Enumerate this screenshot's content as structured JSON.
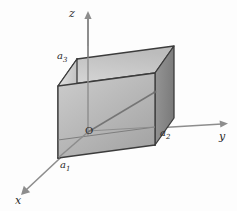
{
  "figure": {
    "background_color": "#fdfdfd",
    "stroke_color": "#3c3c3c",
    "axis_color": "#8d8d8d",
    "labels": {
      "axis_z": "z",
      "axis_y": "y",
      "axis_x": "x",
      "vertex_a1": "a",
      "vertex_a1_sub": "1",
      "vertex_a2": "a",
      "vertex_a2_sub": "2",
      "vertex_a3": "a",
      "vertex_a3_sub": "3",
      "origin": "O"
    },
    "icons": {
      "z_axis_arrow": "arrow-up-icon",
      "y_axis_arrow": "arrow-right-icon",
      "x_axis_arrow": "arrow-down-left-icon"
    },
    "faces": {
      "top_fill_light": "#d6d6d6",
      "top_fill_dark": "#bdbdbd",
      "left_fill_light": "#e4e4e4",
      "left_fill_dark": "#c0c0c0",
      "front_fill_light": "#c9c9c9",
      "front_fill_dark": "#a4a4a4",
      "right_fill_light": "#949494",
      "right_fill_dark": "#7e7e7e"
    },
    "geometry": {
      "origin": [
        88,
        132
      ],
      "z_axis_tip": [
        88,
        13
      ],
      "y_axis_tip": [
        227,
        124
      ],
      "x_axis_tip": [
        21,
        194
      ],
      "box_front_bottom_left": [
        58,
        158
      ],
      "box_front_bottom_right": [
        155,
        145
      ],
      "box_front_top_left": [
        58,
        86
      ],
      "box_front_top_right": [
        155,
        73
      ],
      "box_back_top_left": [
        77,
        59
      ],
      "box_back_top_right": [
        174,
        46
      ],
      "box_back_bottom_right": [
        174,
        118
      ],
      "box_interior_corner": [
        155,
        92
      ],
      "diagonal_from": [
        88,
        132
      ],
      "diagonal_to": [
        155,
        92
      ]
    }
  }
}
